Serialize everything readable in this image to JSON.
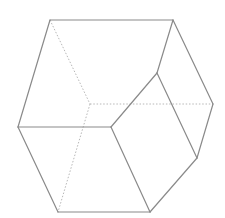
{
  "diagram": {
    "type": "polyhedron-wireframe",
    "colors": {
      "background": "#ffffff",
      "solid_edge": "#8a8a8a",
      "hidden_edge": "#b8b8b8"
    },
    "vertices": {
      "A": [
        50,
        20
      ],
      "B": [
        173,
        20
      ],
      "C": [
        213,
        104
      ],
      "D": [
        197,
        158
      ],
      "E": [
        150,
        212
      ],
      "F": [
        58,
        212
      ],
      "G": [
        18,
        127
      ],
      "H": [
        157,
        73
      ],
      "I": [
        111,
        127
      ],
      "J": [
        90,
        104
      ]
    },
    "solid_edges": [
      [
        "A",
        "B"
      ],
      [
        "B",
        "C"
      ],
      [
        "C",
        "D"
      ],
      [
        "D",
        "E"
      ],
      [
        "E",
        "F"
      ],
      [
        "F",
        "G"
      ],
      [
        "G",
        "A"
      ],
      [
        "B",
        "H"
      ],
      [
        "H",
        "I"
      ],
      [
        "H",
        "D"
      ],
      [
        "I",
        "E"
      ],
      [
        "G",
        "I"
      ]
    ],
    "hidden_edges": [
      [
        "A",
        "J"
      ],
      [
        "J",
        "C"
      ],
      [
        "J",
        "F"
      ]
    ]
  }
}
